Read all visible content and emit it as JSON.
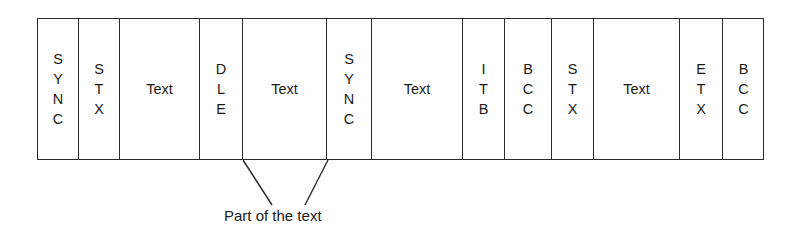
{
  "diagram": {
    "frame": {
      "border_color": "#2b2b2b",
      "background_color": "#ffffff"
    },
    "fields": [
      {
        "name": "sync-1",
        "label": "SYNC",
        "orientation": "stacked",
        "width": 41
      },
      {
        "name": "stx-1",
        "label": "STX",
        "orientation": "stacked",
        "width": 41
      },
      {
        "name": "text-1",
        "label": "Text",
        "orientation": "horizontal",
        "width": 80
      },
      {
        "name": "dle-1",
        "label": "DLE",
        "orientation": "stacked",
        "width": 43
      },
      {
        "name": "text-2",
        "label": "Text",
        "orientation": "horizontal",
        "width": 84
      },
      {
        "name": "sync-2",
        "label": "SYNC",
        "orientation": "stacked",
        "width": 45
      },
      {
        "name": "text-3",
        "label": "Text",
        "orientation": "horizontal",
        "width": 91
      },
      {
        "name": "itb-1",
        "label": "ITB",
        "orientation": "stacked",
        "width": 42
      },
      {
        "name": "bcc-1",
        "label": "BCC",
        "orientation": "stacked",
        "width": 47
      },
      {
        "name": "stx-2",
        "label": "STX",
        "orientation": "stacked",
        "width": 42
      },
      {
        "name": "text-4",
        "label": "Text",
        "orientation": "horizontal",
        "width": 86
      },
      {
        "name": "etx-1",
        "label": "ETX",
        "orientation": "stacked",
        "width": 43
      },
      {
        "name": "bcc-2",
        "label": "BCC",
        "orientation": "stacked",
        "width": 41
      }
    ],
    "annotation": {
      "text": "Part of the text",
      "line_color": "#2b2b2b",
      "leaders": [
        {
          "name": "leader-to-dle",
          "x1": 243,
          "y1": 160,
          "x2": 272,
          "y2": 205
        },
        {
          "name": "leader-to-sync",
          "x1": 328,
          "y1": 160,
          "x2": 305,
          "y2": 205
        }
      ]
    }
  }
}
